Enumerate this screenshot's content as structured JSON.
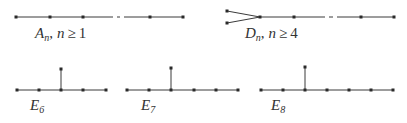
{
  "diagrams": {
    "A": {
      "letter": "A",
      "sub": "n",
      "sep": ",",
      "var": "n",
      "rel": "≥",
      "bound": "1",
      "nodes": [
        [
          16,
          17
        ],
        [
          50,
          17
        ],
        [
          83,
          17
        ],
        [
          150,
          17
        ],
        [
          183,
          17
        ]
      ],
      "edges": [
        [
          16,
          17,
          113,
          17
        ],
        [
          124,
          17,
          183,
          17
        ]
      ],
      "dash": [
        117,
        17,
        120,
        17
      ]
    },
    "D": {
      "letter": "D",
      "sub": "n",
      "sep": ",",
      "var": "n",
      "rel": "≥",
      "bound": "4",
      "nodes": [
        [
          227,
          11
        ],
        [
          227,
          23
        ],
        [
          260,
          17
        ],
        [
          294,
          17
        ],
        [
          361,
          17
        ],
        [
          394,
          17
        ]
      ],
      "edges": [
        [
          227,
          11,
          260,
          17
        ],
        [
          227,
          23,
          260,
          17
        ],
        [
          260,
          17,
          325,
          17
        ],
        [
          337,
          17,
          394,
          17
        ]
      ],
      "dash": [
        329,
        17,
        333,
        17
      ]
    },
    "E6": {
      "letter": "E",
      "sub": "6",
      "nodes": [
        [
          17,
          90
        ],
        [
          39,
          90
        ],
        [
          61,
          90
        ],
        [
          83,
          90
        ],
        [
          106,
          90
        ],
        [
          61,
          69
        ]
      ],
      "edges": [
        [
          17,
          90,
          106,
          90
        ],
        [
          61,
          69,
          61,
          90
        ]
      ]
    },
    "E7": {
      "letter": "E",
      "sub": "7",
      "nodes": [
        [
          127,
          90
        ],
        [
          149,
          90
        ],
        [
          171,
          90
        ],
        [
          194,
          90
        ],
        [
          216,
          90
        ],
        [
          238,
          90
        ],
        [
          171,
          68
        ]
      ],
      "edges": [
        [
          127,
          90,
          238,
          90
        ],
        [
          171,
          68,
          171,
          90
        ]
      ]
    },
    "E8": {
      "letter": "E",
      "sub": "8",
      "nodes": [
        [
          261,
          90
        ],
        [
          283,
          90
        ],
        [
          305,
          90
        ],
        [
          327,
          90
        ],
        [
          349,
          90
        ],
        [
          371,
          90
        ],
        [
          393,
          90
        ],
        [
          305,
          67
        ]
      ],
      "edges": [
        [
          261,
          90,
          393,
          90
        ],
        [
          305,
          67,
          305,
          90
        ]
      ]
    }
  }
}
